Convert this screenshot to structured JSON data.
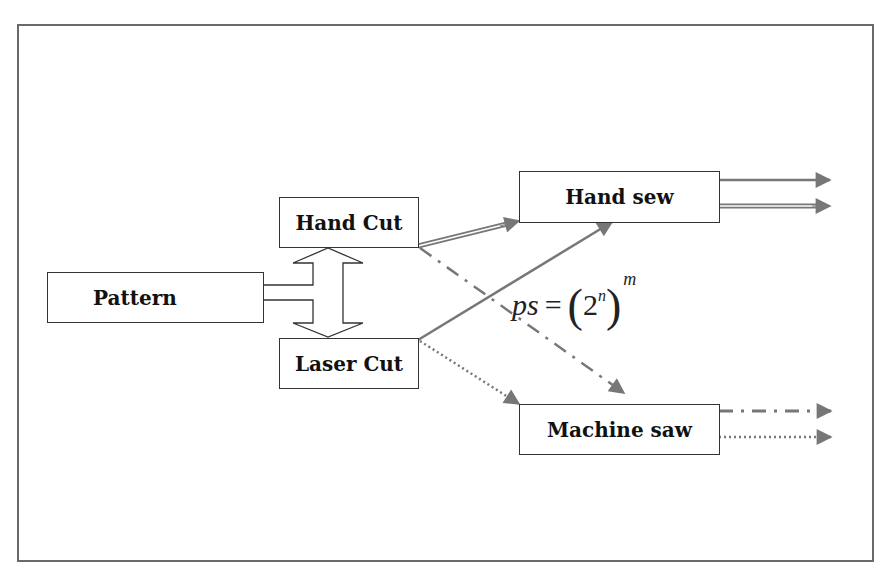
{
  "diagram": {
    "nodes": {
      "pattern": {
        "label": "Pattern"
      },
      "hand_cut": {
        "label": "Hand Cut"
      },
      "laser_cut": {
        "label": "Laser Cut"
      },
      "hand_sew": {
        "label": "Hand sew"
      },
      "machine_saw": {
        "label": "Machine saw"
      }
    },
    "formula": {
      "lhs": "ps",
      "equals": "=",
      "open_paren": "(",
      "base": "2",
      "inner_exponent": "n",
      "close_paren": ")",
      "outer_exponent": "m"
    },
    "edges": [
      {
        "from": "Pattern",
        "to": "Hand Cut / Laser Cut",
        "style": "hollow double-headed arrow"
      },
      {
        "from": "Hand Cut",
        "to": "Hand sew",
        "style": "double line"
      },
      {
        "from": "Hand Cut",
        "to": "Machine saw",
        "style": "dash-dot"
      },
      {
        "from": "Laser Cut",
        "to": "Hand sew",
        "style": "solid"
      },
      {
        "from": "Laser Cut",
        "to": "Machine saw",
        "style": "dotted"
      },
      {
        "from": "Hand sew",
        "to": "output",
        "style": "solid"
      },
      {
        "from": "Hand sew",
        "to": "output",
        "style": "double line"
      },
      {
        "from": "Machine saw",
        "to": "output",
        "style": "dash-dot"
      },
      {
        "from": "Machine saw",
        "to": "output",
        "style": "dotted"
      }
    ],
    "colors": {
      "frame": "#6a6a6a",
      "box_border": "#333333",
      "arrow": "#777777",
      "text": "#111111"
    }
  }
}
